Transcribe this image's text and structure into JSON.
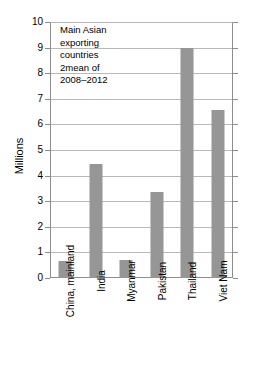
{
  "chart_data": {
    "type": "bar",
    "title": "",
    "categories": [
      "China, mainland",
      "India",
      "Myanmar",
      "Pakistan",
      "Thailand",
      "Viet Nam"
    ],
    "values": [
      0.65,
      4.45,
      0.72,
      3.35,
      9.0,
      6.55
    ],
    "xlabel": "",
    "ylabel": "Millions",
    "ylim": [
      0,
      10
    ],
    "ytick_labels": [
      "10",
      "9",
      "8",
      "7",
      "6",
      "5",
      "4",
      "3",
      "2",
      "1",
      "0"
    ],
    "ytick_values": [
      10,
      9,
      8,
      7,
      6,
      5,
      4,
      3,
      2,
      1,
      0
    ],
    "grid": true,
    "legend": "none",
    "annotations": [
      "Main Asian",
      "exporting",
      "countries",
      "2mean of",
      "2008–2012"
    ],
    "bar_color": "#969696",
    "gridline_color": "#b9b9b9",
    "axis_color": "#8d8d8d",
    "text_color": "#000000"
  }
}
